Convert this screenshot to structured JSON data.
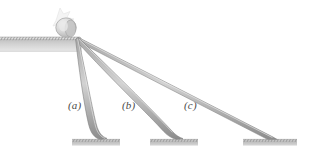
{
  "figure": {
    "name": "inclined-ramps-physics-figure",
    "background_color": "#ffffff",
    "width": 320,
    "height": 157,
    "palette": {
      "rail_fill": "#c9c9c9",
      "rail_edge": "#8f8f8f",
      "rail_edge_dark": "#6f6f6f",
      "ledge_face": "#c3c3c3",
      "ledge_top": "#b4b4b4",
      "hatch": "#8a8a8a",
      "platform_fill": "#c0c0c0",
      "label_color": "#4a4a4a",
      "ball_fill": "#d6d6d6",
      "ball_edge": "#a0a0a0",
      "burst_fill": "#f2f2f2"
    },
    "labels": [
      {
        "id": "a",
        "text": "(a)",
        "x": 72,
        "y": 106
      },
      {
        "id": "b",
        "text": "(b)",
        "x": 126,
        "y": 106
      },
      {
        "id": "c",
        "text": "(c)",
        "x": 188,
        "y": 106
      }
    ],
    "pivot": {
      "x": 78,
      "y": 38
    },
    "ledge": {
      "x": 0,
      "y": 37,
      "width": 82,
      "height": 14
    },
    "ball": {
      "cx": 66,
      "cy": 26,
      "rx": 10,
      "ry": 10
    },
    "ramps": [
      {
        "id": "a",
        "label": "(a)",
        "end_x": 104,
        "end_y": 140,
        "steepness": "steepest"
      },
      {
        "id": "b",
        "label": "(b)",
        "end_x": 180,
        "end_y": 140,
        "steepness": "intermediate"
      },
      {
        "id": "c",
        "label": "(c)",
        "end_x": 277,
        "end_y": 140,
        "steepness": "shallowest"
      }
    ],
    "platforms": [
      {
        "id": "a",
        "x": 72,
        "y": 139,
        "width": 48,
        "height": 6
      },
      {
        "id": "b",
        "x": 150,
        "y": 139,
        "width": 48,
        "height": 6
      },
      {
        "id": "c",
        "x": 243,
        "y": 139,
        "width": 54,
        "height": 6
      }
    ]
  }
}
